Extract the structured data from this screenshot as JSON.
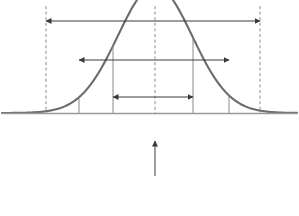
{
  "figure": {
    "type": "normal-distribution-confidence-intervals",
    "curve_color": "#6b6b6b",
    "axis_color": "#9a9a9a",
    "gridline_color": "#8a8a8a",
    "text_color": "#3a3a3a",
    "center_label": "14",
    "center_note_line1": "Obtained difference",
    "center_note_line2": "between sample means",
    "caption_text": "Confidence Intervals",
    "ticks": [
      {
        "value": "5",
        "sed": "–3 SED",
        "x": 46,
        "style": "dashed"
      },
      {
        "value": "8",
        "sed": "–2 SED",
        "x": 79,
        "style": "solid"
      },
      {
        "value": "11",
        "sed": "–1 SED",
        "x": 113,
        "style": "solid"
      },
      {
        "value": "14",
        "sed": "",
        "x": 155,
        "style": "dashed"
      },
      {
        "value": "17",
        "sed": "+1 SED",
        "x": 193,
        "style": "solid"
      },
      {
        "value": "20",
        "sed": "+2 SED",
        "x": 229,
        "style": "solid"
      },
      {
        "value": "23",
        "sed": "+3 SED",
        "x": 260,
        "style": "dashed"
      }
    ],
    "intervals": [
      {
        "label": "99+%",
        "x1": 46,
        "x2": 260,
        "y": 21
      },
      {
        "label": "95%",
        "x1": 79,
        "x2": 229,
        "y": 60
      },
      {
        "label": "68%",
        "x1": 113,
        "x2": 193,
        "y": 97
      }
    ]
  },
  "chart_data": {
    "type": "line",
    "xlabel": "",
    "ylabel": "",
    "grid": false,
    "legend": "none",
    "distribution": "normal",
    "mean": 14,
    "sed": 3,
    "xlim": [
      2,
      26
    ],
    "categories": [
      "5",
      "8",
      "11",
      "14",
      "17",
      "20",
      "23"
    ],
    "x": [
      5,
      8,
      11,
      14,
      17,
      20,
      23
    ],
    "tick_labels_secondary": [
      "–3 SED",
      "–2 SED",
      "–1 SED",
      "",
      "+1 SED",
      "+2 SED",
      "+3 SED"
    ],
    "values": [
      0.011,
      0.135,
      0.607,
      1.0,
      0.607,
      0.135,
      0.011
    ],
    "annotations": [
      {
        "text": "99+%",
        "from": "5",
        "to": "23",
        "kind": "double-arrow"
      },
      {
        "text": "95%",
        "from": "8",
        "to": "20",
        "kind": "double-arrow"
      },
      {
        "text": "68%",
        "from": "11",
        "to": "17",
        "kind": "double-arrow"
      },
      {
        "text": "Obtained difference between sample means",
        "at": "14",
        "kind": "callout"
      }
    ]
  }
}
